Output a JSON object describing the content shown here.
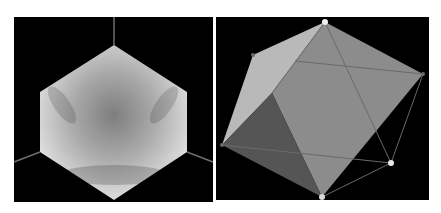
{
  "figure": {
    "width": 441,
    "height": 213,
    "background": "#ffffff",
    "panels": [
      {
        "id": "left",
        "label": "Rendered shaded hexagonal view",
        "rect": {
          "x": 14,
          "y": 17,
          "w": 199,
          "h": 185
        },
        "background": "#000000",
        "hexagon": {
          "points": [
            [
              114,
              45
            ],
            [
              187,
              92
            ],
            [
              187,
              152
            ],
            [
              114,
              200
            ],
            [
              40,
              152
            ],
            [
              40,
              92
            ]
          ],
          "fill_light": "#e6e6e6",
          "fill_dark": "#8a8a8a"
        },
        "axes": [
          {
            "name": "axis-top",
            "from": [
              114,
              17
            ],
            "to": [
              114,
              45
            ]
          },
          {
            "name": "axis-lower-left",
            "from": [
              40,
              152
            ],
            "to": [
              14,
              162
            ]
          },
          {
            "name": "axis-lower-right",
            "from": [
              187,
              152
            ],
            "to": [
              213,
              162
            ]
          }
        ],
        "axis_color": "#6e6e6e"
      },
      {
        "id": "right",
        "label": "Polyhedron wireframe with shaded faces",
        "rect": {
          "x": 216,
          "y": 17,
          "w": 213,
          "h": 183
        },
        "background": "#000000",
        "vertices": {
          "top": [
            325,
            22
          ],
          "upper_left": [
            253,
            55
          ],
          "right": [
            423,
            74
          ],
          "left": [
            222,
            145
          ],
          "lower_right": [
            391,
            163
          ],
          "bottom": [
            322,
            197
          ],
          "inner_upper": [
            295,
            61
          ],
          "inner_mid": [
            272,
            93
          ]
        },
        "faces": [
          {
            "name": "face-light-left",
            "points": [
              [
                325,
                22
              ],
              [
                253,
                55
              ],
              [
                222,
                145
              ],
              [
                272,
                93
              ]
            ],
            "fill": "#b9b9b9"
          },
          {
            "name": "face-front-main",
            "points": [
              [
                325,
                22
              ],
              [
                423,
                74
              ],
              [
                322,
                197
              ],
              [
                272,
                93
              ]
            ],
            "fill": "#8c8c8c"
          },
          {
            "name": "face-dark-lower",
            "points": [
              [
                272,
                93
              ],
              [
                222,
                145
              ],
              [
                322,
                197
              ]
            ],
            "fill": "#555555"
          }
        ],
        "edges": [
          {
            "from": [
              325,
              22
            ],
            "to": [
              391,
              163
            ]
          },
          {
            "from": [
              295,
              61
            ],
            "to": [
              423,
              74
            ]
          },
          {
            "from": [
              222,
              145
            ],
            "to": [
              391,
              163
            ]
          },
          {
            "from": [
              423,
              74
            ],
            "to": [
              391,
              163
            ]
          },
          {
            "from": [
              391,
              163
            ],
            "to": [
              322,
              197
            ]
          },
          {
            "from": [
              325,
              22
            ],
            "to": [
              272,
              93
            ]
          }
        ],
        "edge_color": "#6a6a6a",
        "nodes": [
          {
            "name": "node-top",
            "at": [
              325,
              22
            ],
            "r": 3,
            "fill": "#f0f0f0"
          },
          {
            "name": "node-upper-left",
            "at": [
              253,
              55
            ],
            "r": 2,
            "fill": "#6a6a6a"
          },
          {
            "name": "node-right",
            "at": [
              423,
              74
            ],
            "r": 2,
            "fill": "#6a6a6a"
          },
          {
            "name": "node-left",
            "at": [
              222,
              145
            ],
            "r": 2,
            "fill": "#6a6a6a"
          },
          {
            "name": "node-lower-right",
            "at": [
              391,
              163
            ],
            "r": 3,
            "fill": "#e6e6e6"
          },
          {
            "name": "node-bottom",
            "at": [
              322,
              197
            ],
            "r": 3,
            "fill": "#d9d9d9"
          }
        ]
      }
    ]
  }
}
